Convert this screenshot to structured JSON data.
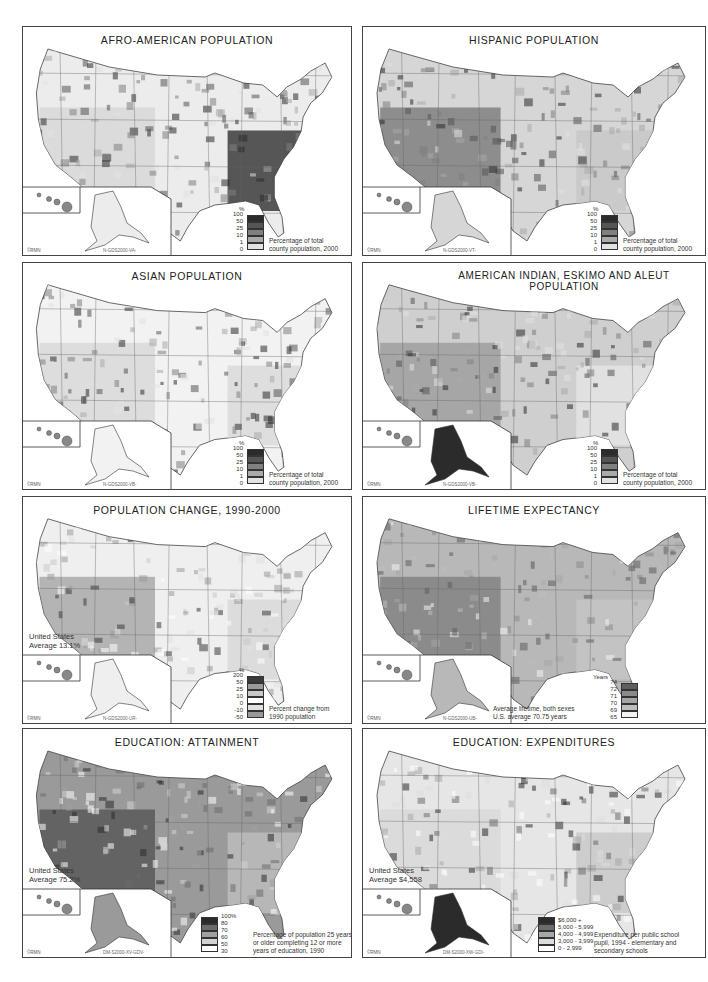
{
  "page": {
    "panels": [
      {
        "id": "afro-american",
        "title": "AFRO-AMERICAN POPULATION",
        "copyright": "©RMN",
        "code": "N-GDS2000-VA-",
        "legend": {
          "unit": "%",
          "ticks": [
            "100",
            "50",
            "25",
            "10",
            "1",
            "0"
          ],
          "colors": [
            "#2b2b2b",
            "#555555",
            "#808080",
            "#aaaaaa",
            "#e2e2e2"
          ],
          "caption": [
            "Percentage of total",
            "county population, 2000"
          ]
        }
      },
      {
        "id": "hispanic",
        "title": "HISPANIC POPULATION",
        "copyright": "©RMN",
        "code": "N-GDS2000-VT-",
        "legend": {
          "unit": "%",
          "ticks": [
            "100",
            "50",
            "25",
            "10",
            "1",
            "0"
          ],
          "colors": [
            "#2b2b2b",
            "#555555",
            "#808080",
            "#aaaaaa",
            "#e2e2e2"
          ],
          "caption": [
            "Percentage of total",
            "county population, 2000"
          ]
        }
      },
      {
        "id": "asian",
        "title": "ASIAN POPULATION",
        "copyright": "©RMN",
        "code": "N-GDS2000-VB-",
        "legend": {
          "unit": "%",
          "ticks": [
            "100",
            "50",
            "25",
            "10",
            "1",
            "0"
          ],
          "colors": [
            "#2b2b2b",
            "#555555",
            "#808080",
            "#aaaaaa",
            "#e2e2e2"
          ],
          "caption": [
            "Percentage of total",
            "county population, 2000"
          ]
        }
      },
      {
        "id": "american-indian",
        "title": "AMERICAN INDIAN, ESKIMO AND ALEUT POPULATION",
        "copyright": "©RMN",
        "code": "N-GDS2000-VB-",
        "legend": {
          "unit": "%",
          "ticks": [
            "100",
            "50",
            "25",
            "10",
            "1",
            "0"
          ],
          "colors": [
            "#2b2b2b",
            "#555555",
            "#808080",
            "#aaaaaa",
            "#e2e2e2"
          ],
          "caption": [
            "Percentage of total",
            "county population, 2000"
          ]
        }
      },
      {
        "id": "population-change",
        "title": "POPULATION CHANGE, 1990-2000",
        "copyright": "©RMN",
        "code": "N-GDS2000-UR-",
        "average_note": [
          "United States",
          "Average 13.1%"
        ],
        "legend": {
          "unit": "%",
          "ticks": [
            "200",
            "50",
            "25",
            "10",
            "0",
            "-10",
            "-50"
          ],
          "colors": [
            "#3a3a3a",
            "#9a9a9a",
            "#c8c8c8",
            "#ffffff",
            "#e0e0e0",
            "#9a9a9a"
          ],
          "caption": [
            "Percent change from",
            "1990 population"
          ]
        }
      },
      {
        "id": "lifetime-expectancy",
        "title": "LIFETIME EXPECTANCY",
        "copyright": "©RMN",
        "code": "N-GDS2000-UB-",
        "legend": {
          "unit": "Years",
          "ticks": [
            "74",
            "72",
            "71",
            "70",
            "69",
            "65"
          ],
          "colors": [
            "#5e5e5e",
            "#8a8a8a",
            "#a5a5a5",
            "#bdbdbd",
            "#f2f2f2"
          ],
          "caption": [
            "Average lifetime, both sexes",
            "U.S. average 70.75 years"
          ]
        }
      },
      {
        "id": "education-attainment",
        "title": "EDUCATION: ATTAINMENT",
        "copyright": "©RMN",
        "code": "DM-S2000-XV-GDV-",
        "average_note": [
          "United States",
          "Average 75.2%"
        ],
        "legend": {
          "unit": "",
          "ticks": [
            "100%",
            "80",
            "70",
            "60",
            "50",
            "30"
          ],
          "colors": [
            "#2b2b2b",
            "#6c6c6c",
            "#a0a0a0",
            "#d3d3d3",
            "#ffffff"
          ],
          "caption": [
            "Percentage of population 25 years",
            "or older completing 12 or more",
            "years of education, 1990"
          ]
        }
      },
      {
        "id": "education-expenditures",
        "title": "EDUCATION: EXPENDITURES",
        "copyright": "©RMN",
        "code": "DM-S2000-XW-GDI-",
        "average_note": [
          "United States",
          "Average $4,558"
        ],
        "legend": {
          "unit": "",
          "ticks": [
            "$6,000 +",
            "5,000 - 5,999",
            "4,000 - 4,999",
            "3,000 - 3,999",
            "0 - 2,999"
          ],
          "colors": [
            "#2b2b2b",
            "#6c6c6c",
            "#a8a8a8",
            "#dddddd",
            "#ffffff"
          ],
          "caption": [
            "Expenditure per public school",
            "pupil, 1994 - elementary and",
            "secondary schools"
          ]
        }
      }
    ]
  }
}
